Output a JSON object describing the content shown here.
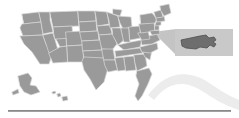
{
  "figure": {
    "name": "united-states-map-with-massachusetts-inset",
    "width": 239,
    "height": 118,
    "background_color": "#ffffff"
  },
  "colors": {
    "state_fill": "#9a9a9a",
    "state_stroke": "#d8d8d8",
    "highlight_fill": "#6e6e6e",
    "highlight_stroke": "#4f4f4f",
    "inset_box_fill": "#c9c9c9",
    "callout_wedge_fill": "#c4c4c4",
    "swoosh_fill": "#ececec",
    "rule_color": "#8a8a8a"
  },
  "map": {
    "name": "usa-contiguous-map",
    "label": "United States map",
    "regions": [
      {
        "id": "contiguous",
        "label": "Contiguous United States"
      },
      {
        "id": "alaska",
        "label": "Alaska"
      },
      {
        "id": "hawaii",
        "label": "Hawaii"
      }
    ]
  },
  "inset": {
    "name": "massachusetts-inset",
    "label": "Massachusetts",
    "state_abbr": "MA",
    "box": {
      "x": 175,
      "y": 29,
      "width": 58,
      "height": 27
    }
  },
  "callout": {
    "name": "callout-wedge",
    "label": "Callout connector from New England to inset"
  },
  "swoosh": {
    "name": "decorative-swoosh",
    "label": "Decorative wave graphic"
  },
  "rule": {
    "name": "bottom-rule",
    "label": "Horizontal divider line"
  }
}
